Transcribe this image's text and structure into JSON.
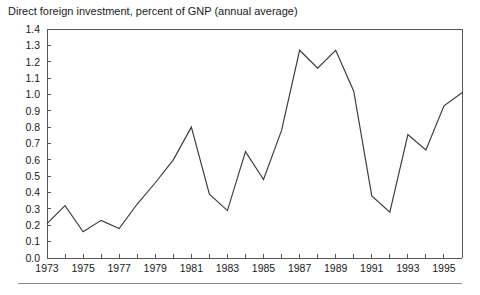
{
  "chart_data": {
    "type": "line",
    "title": "Direct foreign investment, percent of GNP (annual average)",
    "xlabel": "",
    "ylabel": "",
    "grid": false,
    "legend": false,
    "xlim": [
      1973,
      1996
    ],
    "ylim": [
      0.0,
      1.4
    ],
    "ytick_step": 0.1,
    "xtick_step": 1,
    "xtick_label_step": 2,
    "yticks": [
      "0.0",
      "0.1",
      "0.2",
      "0.3",
      "0.4",
      "0.5",
      "0.6",
      "0.7",
      "0.8",
      "0.9",
      "1.0",
      "1.1",
      "1.2",
      "1.3",
      "1.4"
    ],
    "xticks": [
      1973,
      1974,
      1975,
      1976,
      1977,
      1978,
      1979,
      1980,
      1981,
      1982,
      1983,
      1984,
      1985,
      1986,
      1987,
      1988,
      1989,
      1990,
      1991,
      1992,
      1993,
      1994,
      1995,
      1996
    ],
    "xtick_labels": [
      "1973",
      "",
      "1975",
      "",
      "1977",
      "",
      "1979",
      "",
      "1981",
      "",
      "1983",
      "",
      "1985",
      "",
      "1987",
      "",
      "1989",
      "",
      "1991",
      "",
      "1993",
      "",
      "1995",
      ""
    ],
    "x": [
      1973,
      1974,
      1975,
      1976,
      1977,
      1978,
      1979,
      1980,
      1981,
      1982,
      1983,
      1984,
      1985,
      1986,
      1987,
      1988,
      1989,
      1990,
      1991,
      1992,
      1993,
      1994,
      1995,
      1996
    ],
    "values": [
      0.21,
      0.32,
      0.16,
      0.23,
      0.18,
      0.33,
      0.46,
      0.6,
      0.8,
      0.39,
      0.29,
      0.65,
      0.48,
      0.78,
      1.27,
      1.16,
      1.27,
      1.02,
      0.38,
      0.28,
      0.755,
      0.66,
      0.93,
      1.01
    ],
    "series_name": "Direct foreign investment",
    "line_color": "#3a3a3a",
    "axis_color": "#555555"
  },
  "figure": {
    "footer_rule_color": "#8a8a8a"
  }
}
